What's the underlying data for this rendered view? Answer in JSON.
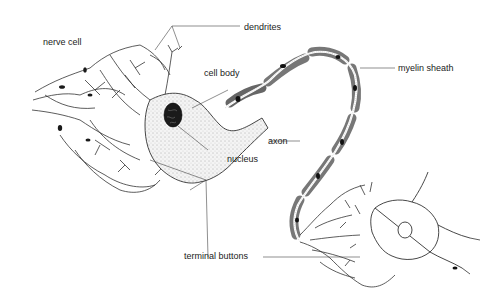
{
  "diagram": {
    "title": "nerve cell",
    "labels": {
      "dendrites": "dendrites",
      "cell_body": "cell body",
      "myelin_sheath": "myelin sheath",
      "axon": "axon",
      "nucleus": "nucleus",
      "terminal_buttons": "terminal buttons"
    },
    "colors": {
      "myelin": "#8a8a8a",
      "myelin_dark": "#555555",
      "line": "#333333",
      "nucleus": "#1a1a1a"
    }
  }
}
